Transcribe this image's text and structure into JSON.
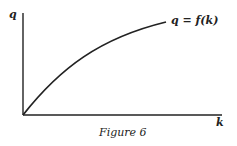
{
  "figure": {
    "y_axis_label": "q",
    "x_axis_label": "k",
    "curve_label": "q = f(k)",
    "caption": "Figure 6",
    "colors": {
      "ink": "#222222",
      "background": "#ffffff"
    }
  }
}
